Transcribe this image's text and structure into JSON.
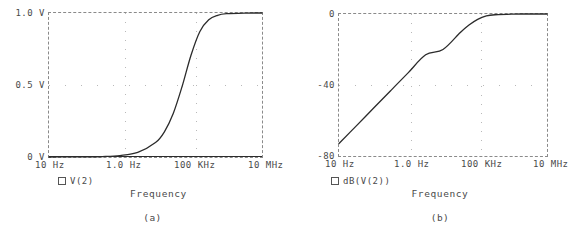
{
  "figure": {
    "panels": [
      {
        "caption": "(a)",
        "axis_title": "Frequency",
        "legend": {
          "marker": "square-marker",
          "label": "V(2)"
        },
        "chart": {
          "type": "line",
          "title": "",
          "xlabel": "Frequency",
          "ylabel": "",
          "xscale": "log",
          "xlim": [
            10,
            10000000
          ],
          "ylim": [
            0,
            1.0
          ],
          "grid": true,
          "legend_position": "below-left",
          "xticks": [
            {
              "value": 10,
              "label": "10 Hz"
            },
            {
              "value": 1000,
              "label": "1.0 Hz"
            },
            {
              "value": 100000,
              "label": "100 KHz"
            },
            {
              "value": 10000000,
              "label": "10 MHz"
            }
          ],
          "yticks": [
            {
              "value": 0,
              "label": "0 V"
            },
            {
              "value": 0.5,
              "label": "0.5 V"
            },
            {
              "value": 1.0,
              "label": "1.0 V"
            }
          ],
          "series": [
            {
              "name": "V(2)",
              "x": [
                10,
                31.6,
                100,
                316,
                1000,
                3160,
                10000,
                17800,
                31600,
                56200,
                100000,
                178000,
                316000,
                562000,
                1000000,
                3160000,
                10000000
              ],
              "y": [
                0.0001,
                0.0003,
                0.001,
                0.0032,
                0.01,
                0.0316,
                0.1,
                0.175,
                0.302,
                0.49,
                0.707,
                0.872,
                0.953,
                0.984,
                0.995,
                0.9995,
                1.0
              ]
            }
          ]
        }
      },
      {
        "caption": "(b)",
        "axis_title": "Frequency",
        "legend": {
          "marker": "square-marker",
          "label": "dB(V(2))"
        },
        "chart": {
          "type": "line",
          "title": "",
          "xlabel": "Frequency",
          "ylabel": "",
          "xscale": "log",
          "xlim": [
            10,
            10000000
          ],
          "ylim": [
            -80,
            0
          ],
          "grid": true,
          "legend_position": "below-left",
          "xticks": [
            {
              "value": 10,
              "label": "10 Hz"
            },
            {
              "value": 1000,
              "label": "1.0 Hz"
            },
            {
              "value": 100000,
              "label": "100 KHz"
            },
            {
              "value": 10000000,
              "label": "10 MHz"
            }
          ],
          "yticks": [
            {
              "value": 0,
              "label": "0"
            },
            {
              "value": -40,
              "label": "-40"
            },
            {
              "value": -80,
              "label": "-80"
            }
          ],
          "series": [
            {
              "name": "dB(V(2))",
              "x": [
                10,
                31.6,
                100,
                316,
                1000,
                3160,
                10000,
                31600,
                56200,
                100000,
                178000,
                316000,
                1000000,
                3160000,
                10000000
              ],
              "y": [
                -73.0,
                -63.0,
                -53.0,
                -43.0,
                -33.0,
                -23.0,
                -20.0,
                -10.4,
                -6.2,
                -3.0,
                -1.1,
                -0.42,
                -0.04,
                -0.004,
                0.0
              ]
            }
          ]
        }
      }
    ]
  },
  "style": {
    "curve_color": "#2b2b2b",
    "frame_color": "#8a8a8a",
    "grid_color": "#b9b9b9",
    "text_color": "#4a4a4a",
    "background": "#ffffff"
  }
}
